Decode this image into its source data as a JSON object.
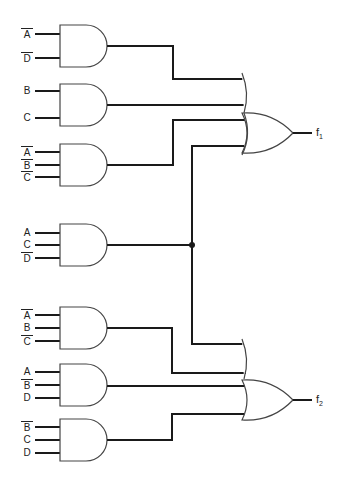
{
  "diagram": {
    "type": "two-level AND-OR logic circuit",
    "and_gates": [
      {
        "id": "g1",
        "inputs": [
          {
            "var": "A",
            "negated": true
          },
          {
            "var": "D",
            "negated": true
          }
        ],
        "feeds": "f1"
      },
      {
        "id": "g2",
        "inputs": [
          {
            "var": "B",
            "negated": false
          },
          {
            "var": "C",
            "negated": false
          }
        ],
        "feeds": "f1"
      },
      {
        "id": "g3",
        "inputs": [
          {
            "var": "A",
            "negated": true
          },
          {
            "var": "B",
            "negated": true
          },
          {
            "var": "C",
            "negated": true
          }
        ],
        "feeds": "f1"
      },
      {
        "id": "g4",
        "inputs": [
          {
            "var": "A",
            "negated": false
          },
          {
            "var": "C",
            "negated": false
          },
          {
            "var": "D",
            "negated": true
          }
        ],
        "feeds": "f1,f2"
      },
      {
        "id": "g5",
        "inputs": [
          {
            "var": "A",
            "negated": true
          },
          {
            "var": "B",
            "negated": false
          },
          {
            "var": "C",
            "negated": true
          }
        ],
        "feeds": "f2"
      },
      {
        "id": "g6",
        "inputs": [
          {
            "var": "A",
            "negated": false
          },
          {
            "var": "B",
            "negated": true
          },
          {
            "var": "D",
            "negated": false
          }
        ],
        "feeds": "f2"
      },
      {
        "id": "g7",
        "inputs": [
          {
            "var": "B",
            "negated": true
          },
          {
            "var": "C",
            "negated": false
          },
          {
            "var": "D",
            "negated": false
          }
        ],
        "feeds": "f2"
      }
    ],
    "or_gates": [
      {
        "id": "or1",
        "output": "f1",
        "inputs": [
          "g1",
          "g2",
          "g3",
          "g4"
        ]
      },
      {
        "id": "or2",
        "output": "f2",
        "inputs": [
          "g4",
          "g5",
          "g6",
          "g7"
        ]
      }
    ],
    "outputs": {
      "f1": {
        "name": "f",
        "sub": "1"
      },
      "f2": {
        "name": "f",
        "sub": "2"
      }
    },
    "junction": {
      "label": "shared-term-node"
    }
  },
  "labels": {
    "g1": [
      "A",
      "D"
    ],
    "g2": [
      "B",
      "C"
    ],
    "g3": [
      "A",
      "B",
      "C"
    ],
    "g4": [
      "A",
      "C",
      "D"
    ],
    "g5": [
      "A",
      "B",
      "C"
    ],
    "g6": [
      "A",
      "B",
      "D"
    ],
    "g7": [
      "B",
      "C",
      "D"
    ]
  },
  "colors": {
    "wire": "#1a1a1a",
    "gate_outline": "#444444",
    "background": "#ffffff"
  }
}
